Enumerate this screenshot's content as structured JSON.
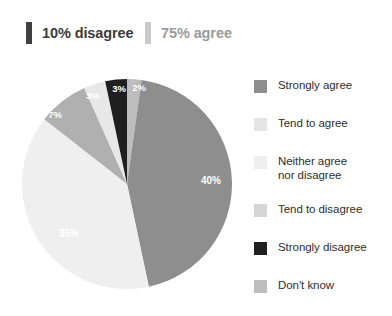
{
  "summary": {
    "items": [
      {
        "label": "10% disagree",
        "bar_color": "#3f3f3f",
        "text_color": "#3b3b3b"
      },
      {
        "label": "75% agree",
        "bar_color": "#c9c9c9",
        "text_color": "#9a9a9a"
      }
    ]
  },
  "legend": {
    "items": [
      {
        "label": "Strongly agree",
        "color": "#8e8e8e"
      },
      {
        "label": "Tend to agree",
        "color": "#e4e4e4"
      },
      {
        "label": "Neither agree\nnor disagree",
        "color": "#efefef"
      },
      {
        "label": "Tend to disagree",
        "color": "#d6d6d6"
      },
      {
        "label": "Strongly disagree",
        "color": "#1f1f1f"
      },
      {
        "label": "Don't know",
        "color": "#bdbdbd"
      }
    ]
  },
  "chart_data": {
    "type": "pie",
    "title": "",
    "start_angle_deg": 0,
    "direction": "clockwise",
    "center": {
      "x": 106,
      "y": 122
    },
    "radius": 105,
    "categories": [
      "Don't know",
      "Strongly agree",
      "Tend to agree",
      "Neither agree nor disagree",
      "Tend to disagree",
      "Strongly disagree"
    ],
    "values": [
      2,
      40,
      35,
      7,
      3,
      3
    ],
    "labels": [
      "2%",
      "40%",
      "35%",
      "7%",
      "3%",
      "3%"
    ],
    "colors": [
      "#bdbdbd",
      "#8e8e8e",
      "#efefef",
      "#b0b0b0",
      "#e8e8e8",
      "#1f1f1f"
    ],
    "label_positions": [
      {
        "x": 118,
        "y": 29
      },
      {
        "x": 190,
        "y": 122
      },
      {
        "x": 48,
        "y": 175
      },
      {
        "x": 34,
        "y": 56
      },
      {
        "x": 72,
        "y": 37
      },
      {
        "x": 98,
        "y": 30
      }
    ],
    "legend_position": "right",
    "grid": false
  }
}
